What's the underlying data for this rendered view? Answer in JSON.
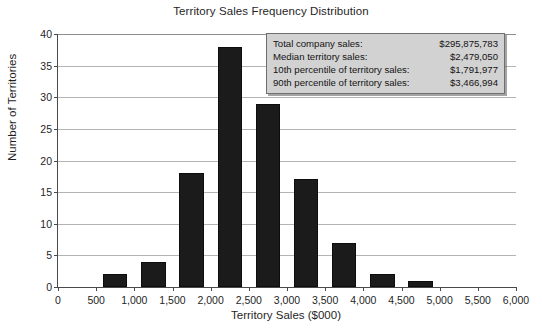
{
  "chart_data": {
    "type": "bar",
    "title": "Territory Sales Frequency Distribution",
    "xlabel": "Territory Sales ($000)",
    "ylabel": "Number of Territories",
    "xlim": [
      0,
      6000
    ],
    "ylim": [
      0,
      40
    ],
    "ytick_step": 5,
    "xtick_step": 500,
    "grid": true,
    "legend": "none",
    "bin_width": 500,
    "bar_color": "#1b1b1b",
    "categories": [
      "0",
      "500",
      "1,000",
      "1,500",
      "2,000",
      "2,500",
      "3,000",
      "3,500",
      "4,000",
      "4,500",
      "5,000",
      "5,500"
    ],
    "bin_starts": [
      0,
      500,
      1000,
      1500,
      2000,
      2500,
      3000,
      3500,
      4000,
      4500,
      5000,
      5500
    ],
    "values": [
      0,
      2,
      4,
      18,
      38,
      29,
      17,
      7,
      2,
      1,
      0,
      0
    ],
    "xticks": [
      "0",
      "500",
      "1,000",
      "1,500",
      "2,000",
      "2,500",
      "3,000",
      "3,500",
      "4,000",
      "4,500",
      "5,000",
      "5,500",
      "6,000"
    ],
    "xtick_values": [
      0,
      500,
      1000,
      1500,
      2000,
      2500,
      3000,
      3500,
      4000,
      4500,
      5000,
      5500,
      6000
    ],
    "yticks": [
      "0",
      "5",
      "10",
      "15",
      "20",
      "25",
      "30",
      "35",
      "40"
    ],
    "ytick_values": [
      0,
      5,
      10,
      15,
      20,
      25,
      30,
      35,
      40
    ]
  },
  "stats_box": {
    "rows": [
      {
        "label": "Total company sales:",
        "value": "$295,875,783"
      },
      {
        "label": "Median territory sales:",
        "value": "$2,479,050"
      },
      {
        "label": "10th percentile of territory sales:",
        "value": "$1,791,977"
      },
      {
        "label": "90th percentile of territory sales:",
        "value": "$3,466,994"
      }
    ]
  }
}
